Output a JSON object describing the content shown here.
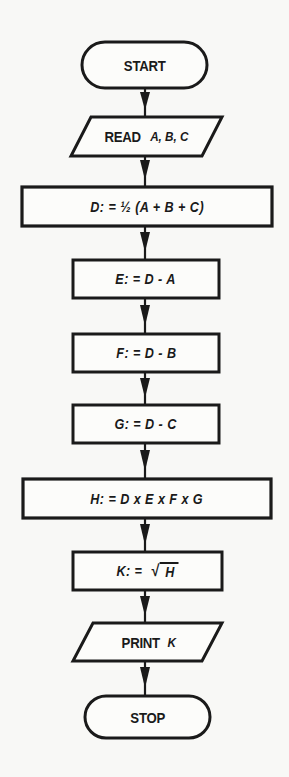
{
  "diagram": {
    "type": "flowchart",
    "title": "",
    "colors": {
      "background": "#f8f8f6",
      "stroke": "#1a1a1a",
      "text": "#1a1a1a"
    },
    "nodes": [
      {
        "id": "start",
        "shape": "terminal",
        "label": "START"
      },
      {
        "id": "read",
        "shape": "parallelogram",
        "keyword": "READ",
        "vars": "A, B, C"
      },
      {
        "id": "d",
        "shape": "process",
        "label": "D: = ½ (A + B + C)"
      },
      {
        "id": "e",
        "shape": "process",
        "label": "E: = D - A"
      },
      {
        "id": "f",
        "shape": "process",
        "label": "F: = D - B"
      },
      {
        "id": "g",
        "shape": "process",
        "label": "G: = D - C"
      },
      {
        "id": "h",
        "shape": "process",
        "label": "H: = D x E x F x G"
      },
      {
        "id": "k",
        "shape": "process",
        "label_prefix": "K: =",
        "sqrt_sign": "√",
        "sqrt_arg": "H"
      },
      {
        "id": "print",
        "shape": "parallelogram",
        "keyword": "PRINT",
        "vars": "K"
      },
      {
        "id": "stop",
        "shape": "terminal",
        "label": "STOP"
      }
    ],
    "edges": [
      {
        "from": "start",
        "to": "read"
      },
      {
        "from": "read",
        "to": "d"
      },
      {
        "from": "d",
        "to": "e"
      },
      {
        "from": "e",
        "to": "f"
      },
      {
        "from": "f",
        "to": "g"
      },
      {
        "from": "g",
        "to": "h"
      },
      {
        "from": "h",
        "to": "k"
      },
      {
        "from": "k",
        "to": "print"
      },
      {
        "from": "print",
        "to": "stop"
      }
    ]
  }
}
